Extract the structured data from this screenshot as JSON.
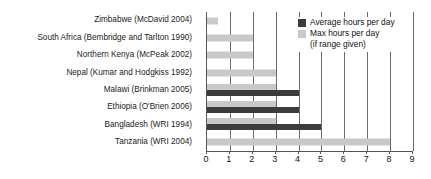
{
  "chart_data": {
    "type": "bar",
    "orientation": "horizontal",
    "title": "",
    "xlabel": "",
    "ylabel": "",
    "xlim": [
      0,
      9
    ],
    "xticks": [
      0,
      1,
      2,
      3,
      4,
      5,
      6,
      7,
      8,
      9
    ],
    "xtick_labels": [
      "0",
      "1",
      "2",
      "3",
      "4",
      "5",
      "6",
      "7",
      "8",
      "9"
    ],
    "grid": "vertical",
    "legend_position": "top-right",
    "categories": [
      "Zimbabwe (McDavid 2004)",
      "South Africa (Bembridge and Tarlton 1990)",
      "Northern Kenya (McPeak 2002)",
      "Nepal (Kumar and Hodgkiss 1992)",
      "Malawi (Brinkman 2005)",
      "Ethiopia (O'Brien 2006)",
      "Bangladesh (WRI 1994)",
      "Tanzania (WRI 2004)"
    ],
    "series": [
      {
        "name": "Max hours per day",
        "color": "#c9c9c9",
        "values": [
          0.5,
          2,
          2,
          3,
          3,
          3,
          3,
          8
        ]
      },
      {
        "name": "Average hours per day",
        "color": "#3c3c3c",
        "values": [
          null,
          null,
          null,
          null,
          4,
          4,
          5,
          null
        ]
      }
    ]
  },
  "legend": {
    "items": [
      {
        "label": "Average hours per day",
        "swatch": "avg"
      },
      {
        "label": "Max hours per day",
        "swatch": "max"
      }
    ],
    "note": "(if range given)"
  }
}
